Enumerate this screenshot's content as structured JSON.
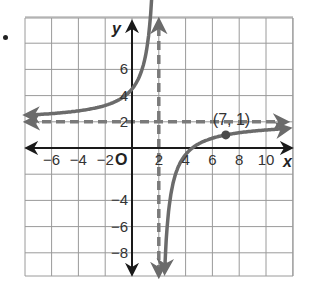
{
  "problem_marker": "bullet",
  "chart_data": {
    "type": "line",
    "title": "",
    "function": "y = 2 - 5/(x - 2)",
    "xlabel": "x",
    "ylabel": "y",
    "origin_label": "O",
    "xlim": [
      -8,
      12
    ],
    "ylim": [
      -10,
      10
    ],
    "grid": true,
    "grid_step": 2,
    "x_tick_labels": [
      "−6",
      "−4",
      "−2",
      "2",
      "4",
      "6",
      "8",
      "10"
    ],
    "y_tick_labels": [
      "6",
      "4",
      "2",
      "−4",
      "−6",
      "−8"
    ],
    "asymptotes": [
      {
        "type": "vertical",
        "value": 2,
        "style": "dashed"
      },
      {
        "type": "horizontal",
        "value": 2,
        "style": "dashed"
      }
    ],
    "labeled_point": {
      "x": 7,
      "y": 1,
      "label": "(7, 1)"
    },
    "series": [
      {
        "name": "left branch",
        "x": [
          -8,
          -6,
          -4,
          -2,
          0,
          1,
          1.5
        ],
        "y": [
          2.5,
          2.63,
          2.83,
          3.25,
          4.5,
          7,
          12
        ]
      },
      {
        "name": "right branch",
        "x": [
          2.5,
          3,
          4,
          4.5,
          5,
          6,
          7,
          8,
          10,
          12
        ],
        "y": [
          -8,
          -3,
          -0.5,
          0,
          0.33,
          0.75,
          1,
          1.17,
          1.38,
          1.5
        ]
      }
    ],
    "colors": {
      "curve": "#6b6b6b",
      "axes": "#1a1a1a",
      "grid": "#9a9a9a",
      "asymptote": "#7a7a7a"
    }
  }
}
